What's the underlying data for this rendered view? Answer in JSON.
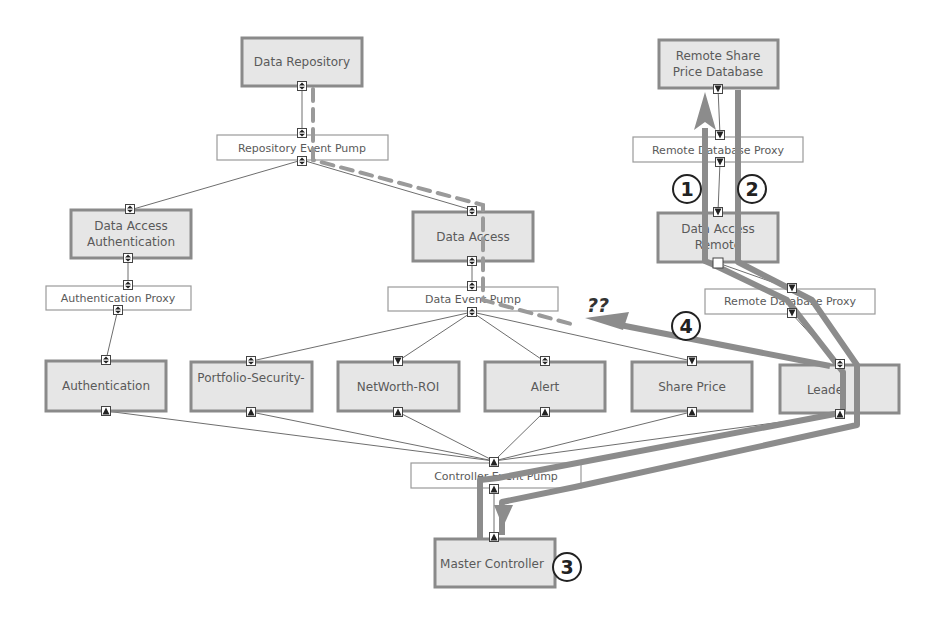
{
  "diagram": {
    "title": "",
    "nodes": [
      {
        "id": "data-repository",
        "label_lines": [
          "Data Repository"
        ],
        "type": "component"
      },
      {
        "id": "repository-event-pump",
        "label_lines": [
          "Repository Event Pump"
        ],
        "type": "event-pump"
      },
      {
        "id": "data-access-authentication",
        "label_lines": [
          "Data Access",
          "Authentication"
        ],
        "type": "component"
      },
      {
        "id": "data-access",
        "label_lines": [
          "Data Access"
        ],
        "type": "component"
      },
      {
        "id": "authentication-proxy",
        "label_lines": [
          "Authentication Proxy"
        ],
        "type": "proxy"
      },
      {
        "id": "data-event-pump",
        "label_lines": [
          "Data Event Pump"
        ],
        "type": "event-pump"
      },
      {
        "id": "authentication",
        "label_lines": [
          "Authentication"
        ],
        "type": "component"
      },
      {
        "id": "portfolio-security-transaction",
        "label_lines": [
          "Portfolio-Security-",
          "Transaction"
        ],
        "type": "component"
      },
      {
        "id": "networth-roi",
        "label_lines": [
          "NetWorth-ROI"
        ],
        "type": "component"
      },
      {
        "id": "alert",
        "label_lines": [
          "Alert"
        ],
        "type": "component"
      },
      {
        "id": "share-price",
        "label_lines": [
          "Share Price"
        ],
        "type": "component"
      },
      {
        "id": "leader",
        "label_lines": [
          "Leade"
        ],
        "type": "component"
      },
      {
        "id": "controller-event-pump",
        "label_lines": [
          "Controller Event Pump"
        ],
        "type": "event-pump"
      },
      {
        "id": "master-controller",
        "label_lines": [
          "Master Controller"
        ],
        "type": "component"
      },
      {
        "id": "remote-share-price-database",
        "label_lines": [
          "Remote Share",
          "Price Database"
        ],
        "type": "component"
      },
      {
        "id": "remote-database-proxy-top",
        "label_lines": [
          "Remote Database Proxy"
        ],
        "type": "proxy"
      },
      {
        "id": "data-access-remote",
        "label_lines": [
          "Data Access",
          "Remote"
        ],
        "type": "component"
      },
      {
        "id": "remote-database-proxy-bottom",
        "label_lines": [
          "Remote Database Proxy"
        ],
        "type": "proxy"
      }
    ],
    "edges": [
      [
        "data-repository",
        "repository-event-pump"
      ],
      [
        "repository-event-pump",
        "data-access-authentication"
      ],
      [
        "repository-event-pump",
        "data-access"
      ],
      [
        "data-access-authentication",
        "authentication-proxy"
      ],
      [
        "authentication-proxy",
        "authentication"
      ],
      [
        "data-access",
        "data-event-pump"
      ],
      [
        "data-event-pump",
        "portfolio-security-transaction"
      ],
      [
        "data-event-pump",
        "networth-roi"
      ],
      [
        "data-event-pump",
        "alert"
      ],
      [
        "data-event-pump",
        "share-price"
      ],
      [
        "authentication",
        "controller-event-pump"
      ],
      [
        "portfolio-security-transaction",
        "controller-event-pump"
      ],
      [
        "networth-roi",
        "controller-event-pump"
      ],
      [
        "alert",
        "controller-event-pump"
      ],
      [
        "share-price",
        "controller-event-pump"
      ],
      [
        "leader",
        "controller-event-pump"
      ],
      [
        "controller-event-pump",
        "master-controller"
      ],
      [
        "remote-share-price-database",
        "remote-database-proxy-top"
      ],
      [
        "remote-database-proxy-top",
        "data-access-remote"
      ],
      [
        "data-access-remote",
        "remote-database-proxy-bottom"
      ],
      [
        "remote-database-proxy-bottom",
        "leader"
      ]
    ],
    "annotations": {
      "step1": "1",
      "step2": "2",
      "step3": "3",
      "step4": "4",
      "unknown": "??"
    },
    "colors": {
      "node_fill": "#e6e6e6",
      "node_border": "#8a8a8a",
      "highlight_path": "#8c8c8c",
      "dashed_path": "#9a9a9a",
      "connector": "#6e6e6e"
    }
  }
}
